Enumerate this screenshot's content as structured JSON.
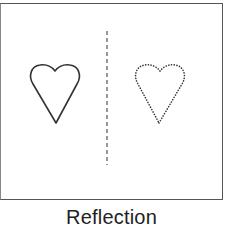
{
  "figure": {
    "caption": "Reflection",
    "shapes": [
      {
        "name": "original-heart",
        "style": "solid"
      },
      {
        "name": "reflected-heart",
        "style": "dotted"
      }
    ],
    "mirror_line": {
      "style": "dashed",
      "orientation": "vertical"
    },
    "colors": {
      "stroke": "#333333",
      "border": "#555555",
      "background": "#ffffff"
    }
  }
}
